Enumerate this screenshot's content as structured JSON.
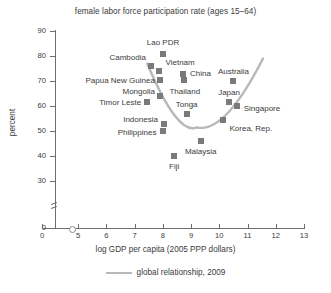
{
  "chart_data": {
    "type": "scatter",
    "title": "female labor force participation rate (ages 15–64)",
    "xlabel": "log GDP per capita (2005 PPP dollars)",
    "ylabel": "percent",
    "xlim": [
      4.5,
      13
    ],
    "ylim": [
      28,
      92
    ],
    "grid": false,
    "xticks": [
      {
        "value": 0,
        "label": "0"
      },
      {
        "value": 5,
        "label": "5"
      },
      {
        "value": 6,
        "label": "6"
      },
      {
        "value": 7,
        "label": "7"
      },
      {
        "value": 8,
        "label": "8"
      },
      {
        "value": 9,
        "label": "9"
      },
      {
        "value": 10,
        "label": "10"
      },
      {
        "value": 11,
        "label": "11"
      },
      {
        "value": 12,
        "label": "12"
      },
      {
        "value": 13,
        "label": "13"
      }
    ],
    "yticks": [
      {
        "value": 0,
        "label": "0"
      },
      {
        "value": 30,
        "label": "30"
      },
      {
        "value": 40,
        "label": "40"
      },
      {
        "value": 50,
        "label": "50"
      },
      {
        "value": 60,
        "label": "60"
      },
      {
        "value": 70,
        "label": "70"
      },
      {
        "value": 80,
        "label": "80"
      },
      {
        "value": 90,
        "label": "90"
      }
    ],
    "axis_breaks": {
      "y": true,
      "x": true
    },
    "points": [
      {
        "label": "Lao PDR",
        "x": 8.0,
        "y": 81.0
      },
      {
        "label": "Cambodia",
        "x": 7.6,
        "y": 76.0
      },
      {
        "label": "Vietnam",
        "x": 7.85,
        "y": 74.0
      },
      {
        "label": "Papua New Guinea",
        "x": 7.92,
        "y": 70.5
      },
      {
        "label": "China",
        "x": 8.72,
        "y": 73.0
      },
      {
        "label": "Thailand",
        "x": 8.75,
        "y": 70.5
      },
      {
        "label": "Australia",
        "x": 10.5,
        "y": 70.0
      },
      {
        "label": "Mongolia",
        "x": 7.92,
        "y": 64.0
      },
      {
        "label": "Timor Leste",
        "x": 7.45,
        "y": 61.5
      },
      {
        "label": "Japan",
        "x": 10.35,
        "y": 61.5
      },
      {
        "label": "Singapore",
        "x": 10.62,
        "y": 60.0
      },
      {
        "label": "Tonga",
        "x": 8.85,
        "y": 57.0
      },
      {
        "label": "Korea, Rep.",
        "x": 10.15,
        "y": 54.5
      },
      {
        "label": "Indonesia",
        "x": 8.05,
        "y": 53.0
      },
      {
        "label": "Philippines",
        "x": 8.0,
        "y": 50.0
      },
      {
        "label": "Malaysia",
        "x": 9.35,
        "y": 46.0
      },
      {
        "label": "Fiji",
        "x": 8.4,
        "y": 40.0
      }
    ],
    "trend": {
      "name": "global relationship, 2009",
      "color": "#b8b8b8",
      "shape": "u-curve",
      "x_start": 7.45,
      "x_end": 11.55,
      "y_start": 77.0,
      "y_min": 51.5,
      "x_min": 9.2,
      "y_end": 79.0
    },
    "legend": {
      "position": "bottom-center",
      "entries": [
        {
          "label": "global relationship, 2009",
          "color": "#b8b8b8",
          "style": "line"
        }
      ]
    },
    "colors": {
      "marker": "#7a7a7a",
      "axis": "#6e6e6e",
      "text": "#3b3b3b",
      "trend": "#b8b8b8",
      "background": "#ffffff"
    }
  }
}
